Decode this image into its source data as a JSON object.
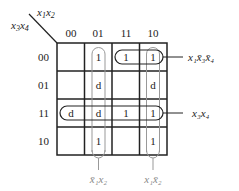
{
  "kmap": {
    "row_variables": "x3x4",
    "col_variables": "x1x2",
    "col_headers": [
      "00",
      "01",
      "11",
      "10"
    ],
    "row_headers": [
      "00",
      "01",
      "11",
      "10"
    ],
    "cells": [
      [
        "",
        "1",
        "1",
        "1"
      ],
      [
        "",
        "d",
        "",
        "d"
      ],
      [
        "d",
        "d",
        "1",
        "1"
      ],
      [
        "",
        "1",
        "",
        "1"
      ]
    ]
  },
  "groups": [
    {
      "name": "x1 x3' x4'",
      "label": "x₁x̄₃x̄₄"
    },
    {
      "name": "x3 x4",
      "label": "x₃x₄"
    },
    {
      "name": "x1' x2",
      "label": "x̄₁x₂"
    },
    {
      "name": "x1 x2'",
      "label": "x₁x̄₂"
    }
  ]
}
